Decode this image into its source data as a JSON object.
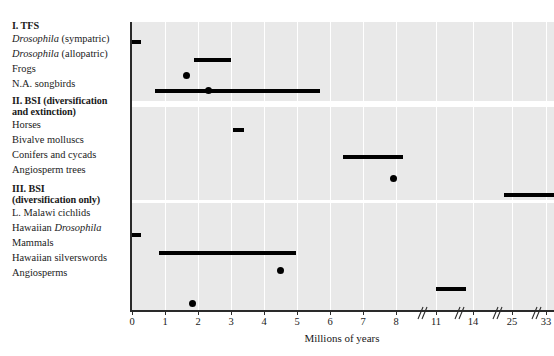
{
  "figure": {
    "axis_title": "Millions of years",
    "x_tick_labels": [
      "0",
      "1",
      "2",
      "3",
      "4",
      "5",
      "6",
      "7",
      "8",
      "11",
      "14",
      "25",
      "33"
    ],
    "mark_color": "#000000",
    "panel_color": "#e9e9e9",
    "gridline_color": "#ffffff"
  },
  "sections": [
    {
      "heading": "I. TFS",
      "heading_lines": [
        "I. TFS"
      ],
      "rows": [
        {
          "label_html": "<i>Drosophila</i> (sympatric)",
          "label_text": "Drosophila (sympatric)"
        },
        {
          "label_html": "<i>Drosophila</i> (allopatric)",
          "label_text": "Drosophila (allopatric)"
        },
        {
          "label_html": "Frogs",
          "label_text": "Frogs"
        },
        {
          "label_html": "N.A. songbirds",
          "label_text": "N.A. songbirds"
        }
      ]
    },
    {
      "heading": "II. BSI (diversification and extinction)",
      "heading_lines": [
        "II. BSI (diversification",
        "and extinction)"
      ],
      "rows": [
        {
          "label_html": "Horses",
          "label_text": "Horses"
        },
        {
          "label_html": "Bivalve molluscs",
          "label_text": "Bivalve molluscs"
        },
        {
          "label_html": "Conifers and cycads",
          "label_text": "Conifers and cycads"
        },
        {
          "label_html": "Angiosperm trees",
          "label_text": "Angiosperm trees"
        }
      ]
    },
    {
      "heading": "III. BSI (diversification only)",
      "heading_lines": [
        "III. BSI",
        "(diversification only)"
      ],
      "rows": [
        {
          "label_html": "L. Malawi cichlids",
          "label_text": "L. Malawi cichlids"
        },
        {
          "label_html": "Hawaiian <i>Drosophila</i>",
          "label_text": "Hawaiian Drosophila"
        },
        {
          "label_html": "Mammals",
          "label_text": "Mammals"
        },
        {
          "label_html": "Hawaiian silverswords",
          "label_text": "Hawaiian silverswords"
        },
        {
          "label_html": "Angiosperms",
          "label_text": "Angiosperms"
        }
      ]
    }
  ],
  "chart_data": {
    "type": "bar",
    "title": "",
    "xlabel": "Millions of years",
    "ylabel": "",
    "xlim": [
      0,
      33
    ],
    "grid": true,
    "legend": "none",
    "orientation": "horizontal-range",
    "x_ticks": [
      0,
      1,
      2,
      3,
      4,
      5,
      6,
      7,
      8,
      11,
      14,
      25,
      33
    ],
    "x_tick_labels": [
      "0",
      "1",
      "2",
      "3",
      "4",
      "5",
      "6",
      "7",
      "8",
      "11",
      "14",
      "25",
      "33"
    ],
    "axis_breaks_after": [
      8,
      11,
      14,
      25
    ],
    "categories": [
      "Drosophila (sympatric)",
      "Drosophila (allopatric)",
      "Frogs",
      "N.A. songbirds",
      "Horses",
      "Bivalve molluscs",
      "Conifers and cycads",
      "Angiosperm trees",
      "L. Malawi cichlids",
      "Hawaiian Drosophila",
      "Mammals",
      "Hawaiian silverswords",
      "Angiosperms"
    ],
    "series": [
      {
        "name": "Speciation duration estimates",
        "points": [
          {
            "category": "Drosophila (sympatric)",
            "group": "I. TFS",
            "mark": "range",
            "start": 0.0,
            "end": 0.25
          },
          {
            "category": "Drosophila (allopatric)",
            "group": "I. TFS",
            "mark": "range",
            "start": 1.9,
            "end": 3.0
          },
          {
            "category": "Frogs",
            "group": "I. TFS",
            "mark": "point",
            "value": 1.65
          },
          {
            "category": "N.A. songbirds",
            "group": "I. TFS",
            "mark": "range-with-point",
            "start": 0.7,
            "end": 5.7,
            "value": 2.3
          },
          {
            "category": "Horses",
            "group": "II. BSI",
            "mark": "range",
            "start": 3.05,
            "end": 3.35
          },
          {
            "category": "Bivalve molluscs",
            "group": "II. BSI",
            "mark": "range",
            "start": 6.4,
            "end": 8.2
          },
          {
            "category": "Conifers and cycads",
            "group": "II. BSI",
            "mark": "point",
            "value": 7.9
          },
          {
            "category": "Angiosperm trees",
            "group": "II. BSI",
            "mark": "range",
            "start": 24.2,
            "end": 33.0
          },
          {
            "category": "L. Malawi cichlids",
            "group": "III. BSI",
            "mark": "range",
            "start": 0.02,
            "end": 0.25
          },
          {
            "category": "Hawaiian Drosophila",
            "group": "III. BSI",
            "mark": "range",
            "start": 0.82,
            "end": 5.0
          },
          {
            "category": "Mammals",
            "group": "III. BSI",
            "mark": "point",
            "value": 4.5
          },
          {
            "category": "Hawaiian silverswords",
            "group": "III. BSI",
            "mark": "range",
            "start": 11.1,
            "end": 12.6
          },
          {
            "category": "Angiosperms",
            "group": "III. BSI",
            "mark": "point",
            "value": 1.82
          }
        ]
      }
    ]
  },
  "geometry": {
    "tick_px": [
      2,
      35,
      68,
      101,
      134,
      167,
      200,
      233,
      266,
      306,
      343,
      382,
      416
    ],
    "gridlines_px": [
      35,
      68,
      101,
      134,
      167,
      200,
      233,
      266,
      306,
      343,
      382,
      416
    ],
    "break_px": [
      285,
      322,
      360,
      399
    ],
    "rows_px": {
      "panel1": [
        20,
        38,
        54,
        69
      ],
      "panel2": [
        22,
        49,
        70,
        88
      ],
      "panel3": [
        32,
        50,
        68,
        86,
        100
      ]
    },
    "label_tops": {
      "s1_heading": [
        20
      ],
      "s1_rows": [
        33,
        48,
        63,
        78
      ],
      "s2_heading": [
        95,
        106
      ],
      "s2_rows": [
        118,
        133,
        148,
        163
      ],
      "s3_heading": [
        182,
        193
      ],
      "s3_rows": [
        205,
        220,
        235,
        250,
        265
      ]
    }
  }
}
